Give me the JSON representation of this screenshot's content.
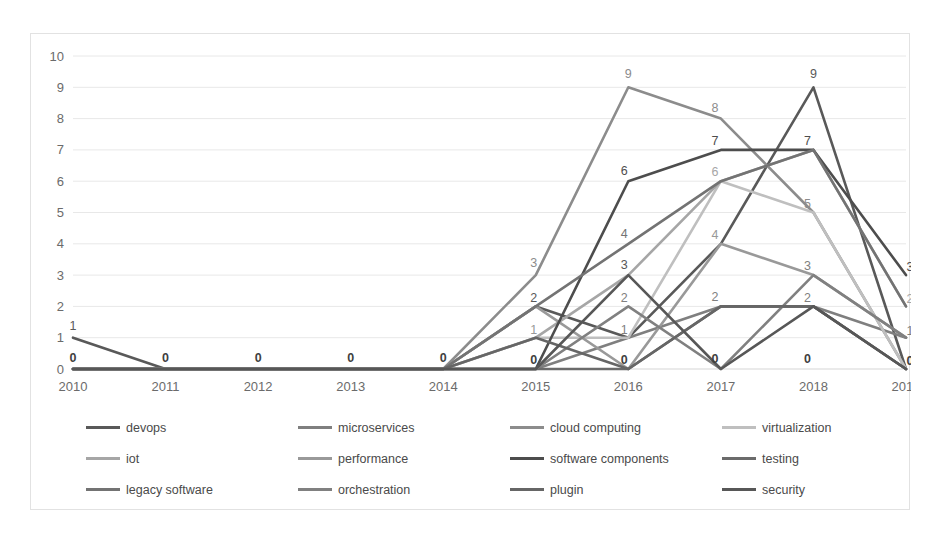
{
  "chart_data": {
    "type": "line",
    "title": "",
    "xlabel": "",
    "ylabel": "",
    "grid": true,
    "legend_position": "bottom",
    "ylim": [
      0,
      10
    ],
    "yticks": [
      "0",
      "1",
      "2",
      "3",
      "4",
      "5",
      "6",
      "7",
      "8",
      "9",
      "10"
    ],
    "categories": [
      "2010",
      "2011",
      "2012",
      "2013",
      "2014",
      "2015",
      "2016",
      "2017",
      "2018",
      "2019"
    ],
    "x": [
      2010,
      2011,
      2012,
      2013,
      2014,
      2015,
      2016,
      2017,
      2018,
      2019
    ],
    "series": [
      {
        "name": "devops",
        "color": "#595959",
        "values": [
          1,
          0,
          0,
          0,
          0,
          2,
          1,
          4,
          9,
          0
        ]
      },
      {
        "name": "microservices",
        "color": "#7f7f7f",
        "values": [
          0,
          0,
          0,
          0,
          0,
          0,
          1,
          2,
          2,
          1
        ]
      },
      {
        "name": "cloud computing",
        "color": "#8c8c8c",
        "values": [
          0,
          0,
          0,
          0,
          0,
          3,
          9,
          8,
          5,
          0
        ]
      },
      {
        "name": "virtualization",
        "color": "#bfbfbf",
        "values": [
          0,
          0,
          0,
          0,
          0,
          1,
          1,
          6,
          5,
          0
        ]
      },
      {
        "name": "iot",
        "color": "#a6a6a6",
        "values": [
          0,
          0,
          0,
          0,
          0,
          1,
          3,
          6,
          7,
          2
        ]
      },
      {
        "name": "performance",
        "color": "#999999",
        "values": [
          0,
          0,
          0,
          0,
          0,
          2,
          0,
          4,
          3,
          1
        ]
      },
      {
        "name": "software components",
        "color": "#4d4d4d",
        "values": [
          0,
          0,
          0,
          0,
          0,
          0,
          6,
          7,
          7,
          3
        ]
      },
      {
        "name": "testing",
        "color": "#6b6b6b",
        "values": [
          0,
          0,
          0,
          0,
          0,
          0,
          0,
          2,
          2,
          0
        ]
      },
      {
        "name": "legacy software",
        "color": "#737373",
        "values": [
          0,
          0,
          0,
          0,
          0,
          2,
          4,
          6,
          7,
          2
        ]
      },
      {
        "name": "orchestration",
        "color": "#808080",
        "values": [
          0,
          0,
          0,
          0,
          0,
          0,
          2,
          0,
          3,
          1
        ]
      },
      {
        "name": "plugin",
        "color": "#666666",
        "values": [
          0,
          0,
          0,
          0,
          0,
          1,
          0,
          2,
          2,
          0
        ]
      },
      {
        "name": "security",
        "color": "#575757",
        "values": [
          0,
          0,
          0,
          0,
          0,
          0,
          3,
          0,
          2,
          0
        ]
      }
    ],
    "point_labels": [
      {
        "x": 2010,
        "y": 1,
        "text": "1",
        "color": "#595959",
        "dx": 0,
        "dy": -8
      },
      {
        "x": 2010,
        "y": 0,
        "text": "0",
        "color": "#3f3f3f",
        "dx": 0,
        "dy": -7
      },
      {
        "x": 2011,
        "y": 0,
        "text": "0",
        "color": "#3f3f3f",
        "dx": 0,
        "dy": -7
      },
      {
        "x": 2012,
        "y": 0,
        "text": "0",
        "color": "#3f3f3f",
        "dx": 0,
        "dy": -7
      },
      {
        "x": 2013,
        "y": 0,
        "text": "0",
        "color": "#3f3f3f",
        "dx": 0,
        "dy": -7
      },
      {
        "x": 2014,
        "y": 0,
        "text": "0",
        "color": "#3f3f3f",
        "dx": 0,
        "dy": -7
      },
      {
        "x": 2015,
        "y": 3,
        "text": "3",
        "color": "#8c8c8c",
        "dx": -2,
        "dy": -8
      },
      {
        "x": 2015,
        "y": 2,
        "text": "2",
        "color": "#595959",
        "dx": -2,
        "dy": -4
      },
      {
        "x": 2015,
        "y": 1,
        "text": "1",
        "color": "#999999",
        "dx": -2,
        "dy": -4
      },
      {
        "x": 2015,
        "y": 0,
        "text": "0",
        "color": "#3f3f3f",
        "dx": -2,
        "dy": -5
      },
      {
        "x": 2016,
        "y": 9,
        "text": "9",
        "color": "#8c8c8c",
        "dx": 0,
        "dy": -9
      },
      {
        "x": 2016,
        "y": 6,
        "text": "6",
        "color": "#4d4d4d",
        "dx": -4,
        "dy": -6
      },
      {
        "x": 2016,
        "y": 4,
        "text": "4",
        "color": "#737373",
        "dx": -4,
        "dy": -6
      },
      {
        "x": 2016,
        "y": 3,
        "text": "3",
        "color": "#575757",
        "dx": -4,
        "dy": -6
      },
      {
        "x": 2016,
        "y": 2,
        "text": "2",
        "color": "#808080",
        "dx": -4,
        "dy": -4
      },
      {
        "x": 2016,
        "y": 1,
        "text": "1",
        "color": "#7f7f7f",
        "dx": -4,
        "dy": -4
      },
      {
        "x": 2016,
        "y": 0,
        "text": "0",
        "color": "#3f3f3f",
        "dx": -4,
        "dy": -5
      },
      {
        "x": 2017,
        "y": 8,
        "text": "8",
        "color": "#8c8c8c",
        "dx": -6,
        "dy": -7
      },
      {
        "x": 2017,
        "y": 7,
        "text": "7",
        "color": "#4d4d4d",
        "dx": -6,
        "dy": -5
      },
      {
        "x": 2017,
        "y": 6,
        "text": "6",
        "color": "#a6a6a6",
        "dx": -6,
        "dy": -5
      },
      {
        "x": 2017,
        "y": 4,
        "text": "4",
        "color": "#999999",
        "dx": -6,
        "dy": -5
      },
      {
        "x": 2017,
        "y": 2,
        "text": "2",
        "color": "#7f7f7f",
        "dx": -6,
        "dy": -5
      },
      {
        "x": 2017,
        "y": 0,
        "text": "0",
        "color": "#3f3f3f",
        "dx": -6,
        "dy": -6
      },
      {
        "x": 2018,
        "y": 9,
        "text": "9",
        "color": "#595959",
        "dx": 0,
        "dy": -9
      },
      {
        "x": 2018,
        "y": 7,
        "text": "7",
        "color": "#4d4d4d",
        "dx": -6,
        "dy": -5
      },
      {
        "x": 2018,
        "y": 5,
        "text": "5",
        "color": "#8c8c8c",
        "dx": -6,
        "dy": -5
      },
      {
        "x": 2018,
        "y": 3,
        "text": "3",
        "color": "#808080",
        "dx": -6,
        "dy": -5
      },
      {
        "x": 2018,
        "y": 2,
        "text": "2",
        "color": "#7f7f7f",
        "dx": -6,
        "dy": -4
      },
      {
        "x": 2018,
        "y": 0,
        "text": "0",
        "color": "#3f3f3f",
        "dx": -6,
        "dy": -6
      },
      {
        "x": 2019,
        "y": 3,
        "text": "3",
        "color": "#4d4d4d",
        "dx": 4,
        "dy": -4
      },
      {
        "x": 2019,
        "y": 2,
        "text": "2",
        "color": "#a6a6a6",
        "dx": 4,
        "dy": -3
      },
      {
        "x": 2019,
        "y": 1,
        "text": "1",
        "color": "#7f7f7f",
        "dx": 4,
        "dy": -3
      },
      {
        "x": 2019,
        "y": 0,
        "text": "0",
        "color": "#3f3f3f",
        "dx": 4,
        "dy": -4
      }
    ]
  },
  "legend": {
    "entries": [
      {
        "label": "devops"
      },
      {
        "label": "microservices"
      },
      {
        "label": "cloud computing"
      },
      {
        "label": "virtualization"
      },
      {
        "label": "iot"
      },
      {
        "label": "performance"
      },
      {
        "label": "software components"
      },
      {
        "label": "testing"
      },
      {
        "label": "legacy software"
      },
      {
        "label": "orchestration"
      },
      {
        "label": "plugin"
      },
      {
        "label": "security"
      }
    ]
  }
}
